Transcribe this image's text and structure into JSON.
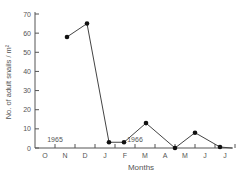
{
  "chart_data": {
    "type": "line",
    "title": "",
    "xlabel": "Months",
    "ylabel": "No. of adult snails / m²",
    "ylim": [
      0,
      70
    ],
    "yticks": [
      0,
      10,
      20,
      30,
      40,
      50,
      60,
      70
    ],
    "categories": [
      "O",
      "N",
      "D",
      "J",
      "F",
      "M",
      "A",
      "M",
      "J",
      "J"
    ],
    "annotations": [
      {
        "text": "1965",
        "near": "O-N"
      },
      {
        "text": "1966",
        "near": "F-M"
      }
    ],
    "grid": false,
    "series": [
      {
        "name": "Adult snails",
        "points": [
          {
            "x": 1.6,
            "y": 58
          },
          {
            "x": 2.6,
            "y": 65
          },
          {
            "x": 3.7,
            "y": 3
          },
          {
            "x": 4.45,
            "y": 3
          },
          {
            "x": 5.55,
            "y": 13
          },
          {
            "x": 7.0,
            "y": 0
          },
          {
            "x": 8.0,
            "y": 8
          },
          {
            "x": 9.25,
            "y": 0.5
          },
          {
            "x": 9.85,
            "y": 0
          }
        ]
      }
    ]
  }
}
